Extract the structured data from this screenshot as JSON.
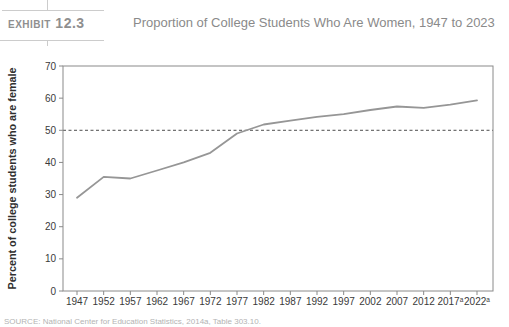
{
  "header": {
    "exhibit_word": "Exhibit",
    "exhibit_number": "12.3",
    "title": "Proportion of College Students Who Are Women, 1947 to 2023"
  },
  "chart_data": {
    "type": "line",
    "title": "Proportion of College Students Who Are Women, 1947 to 2023",
    "categories": [
      "1947",
      "1952",
      "1957",
      "1962",
      "1967",
      "1972",
      "1977",
      "1982",
      "1987",
      "1992",
      "1997",
      "2002",
      "2007",
      "2012",
      "2017ᵃ",
      "2022ᵃ"
    ],
    "values": [
      29,
      35.5,
      35,
      37.5,
      40,
      43,
      49,
      51.8,
      53,
      54.2,
      55,
      56.3,
      57.4,
      57,
      58,
      59.3
    ],
    "xlabel": "",
    "ylabel": "Percent of college students who are female",
    "ylim": [
      0,
      70
    ],
    "yticks": [
      0,
      10,
      20,
      30,
      40,
      50,
      60,
      70
    ],
    "reference_line": {
      "value": 50,
      "style": "dashed"
    },
    "grid": false,
    "legend": false,
    "superscript_marker": "a",
    "colors": {
      "line": "#969696",
      "axis": "#8a8a8a",
      "tick_label": "#3a3a3a",
      "axis_label": "#2f2f2f",
      "reference": "#4d4d4d"
    }
  },
  "source": {
    "text": "SOURCE: National Center for Education Statistics, 2014a, Table 303.10."
  }
}
